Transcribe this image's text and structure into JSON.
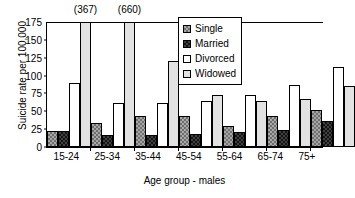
{
  "chart_data": {
    "type": "bar",
    "title": "",
    "xlabel": "Age group - males",
    "ylabel": "Suicide rate per 100,000",
    "ylim": [
      0,
      175
    ],
    "yticks": [
      "0",
      "25",
      "50",
      "75",
      "100",
      "125",
      "150",
      "175"
    ],
    "grid": false,
    "legend_position": "top-right",
    "categories": [
      "15-24",
      "25-34",
      "35-44",
      "45-54",
      "55-64",
      "65-74",
      "75+"
    ],
    "series": [
      {
        "name": "Single",
        "values": [
          22,
          34,
          44,
          44,
          30,
          44,
          52
        ]
      },
      {
        "name": "Married",
        "values": [
          22,
          17,
          17,
          18,
          21,
          24,
          37
        ]
      },
      {
        "name": "Divorced",
        "values": [
          89,
          61,
          62,
          64,
          73,
          87,
          112
        ]
      },
      {
        "name": "Widowed",
        "values": [
          367,
          660,
          121,
          73,
          64,
          67,
          86
        ]
      }
    ],
    "annotations": [
      {
        "text": "(367)",
        "category": "15-24",
        "series": "Widowed",
        "note": "bar truncated at axis maximum"
      },
      {
        "text": "(660)",
        "category": "25-34",
        "series": "Widowed",
        "note": "bar truncated at axis maximum"
      }
    ],
    "colors": {
      "single": "#a8a8a8",
      "married": "#404040",
      "divorced": "#ffffff",
      "widowed": "#e2e2e2",
      "axis": "#000000",
      "background": "#ffffff"
    }
  },
  "legend": {
    "items": [
      {
        "label": "Single",
        "swatch": "checker-medium-gray-swatch"
      },
      {
        "label": "Married",
        "swatch": "checker-dark-gray-swatch"
      },
      {
        "label": "Divorced",
        "swatch": "white-swatch"
      },
      {
        "label": "Widowed",
        "swatch": "light-gray-swatch"
      }
    ]
  }
}
